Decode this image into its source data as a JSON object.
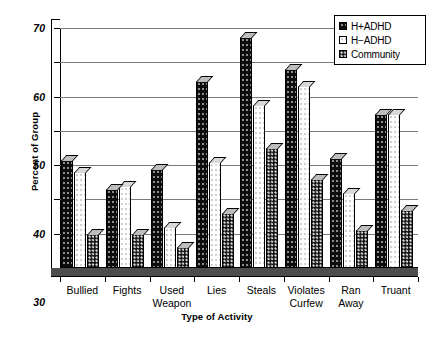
{
  "chart_data": {
    "type": "bar",
    "title": "",
    "xlabel": "Type of Activity",
    "ylabel": "Percent of Group",
    "ylim": [
      0,
      70
    ],
    "yticks": [
      0,
      10,
      20,
      30,
      40,
      50,
      60,
      70
    ],
    "grid": true,
    "legend_position": "top-right",
    "categories": [
      "Bullied",
      "Fights",
      "Used\nWeapon",
      "Lies",
      "Steals",
      "Violates\nCurfew",
      "Ran\nAway",
      "Truant"
    ],
    "series": [
      {
        "name": "H+ADHD",
        "swatch": "black-filled",
        "color": "#0d0d0d",
        "values": [
          31.5,
          23,
          29,
          54.5,
          67.5,
          58,
          32,
          45
        ]
      },
      {
        "name": "H−ADHD",
        "swatch": "white-empty",
        "color": "#ffffff",
        "values": [
          28,
          24,
          12,
          31,
          47.5,
          53,
          22,
          45
        ]
      },
      {
        "name": "Community",
        "swatch": "dotted-pattern",
        "color": "#111111",
        "values": [
          10,
          10,
          6,
          16,
          35,
          26,
          11,
          17
        ]
      }
    ]
  },
  "legend": {
    "items": [
      {
        "label": "H+ADHD"
      },
      {
        "label": "H−ADHD"
      },
      {
        "label": "Community"
      }
    ]
  },
  "axes": {
    "y_title": "Percent of Group",
    "x_title": "Type of Activity",
    "y_tick_labels": [
      "0",
      "10",
      "20",
      "30",
      "40",
      "50",
      "60",
      "70"
    ]
  }
}
